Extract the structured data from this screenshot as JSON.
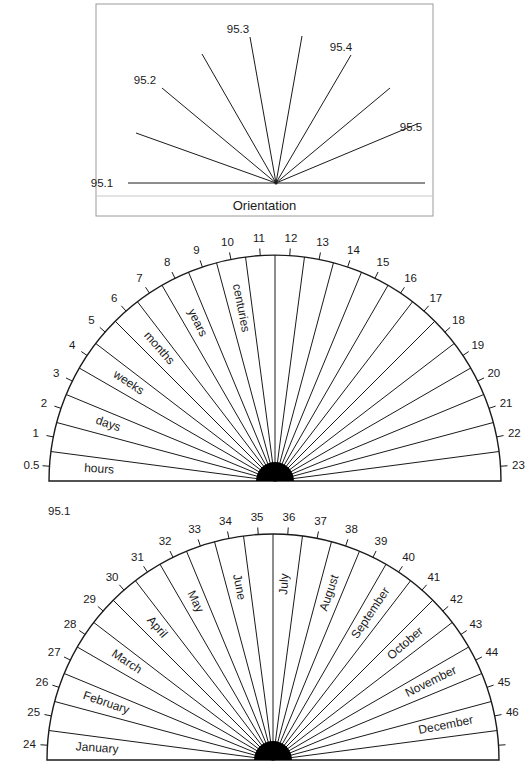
{
  "orientation_panel": {
    "caption": "Orientation",
    "box": {
      "x": 96,
      "y": 4,
      "w": 337,
      "h": 212,
      "separator_y": 196
    },
    "center": [
      276,
      183
    ],
    "lines": [
      {
        "to": [
          128,
          183
        ]
      },
      {
        "to": [
          425,
          183
        ]
      },
      {
        "to": [
          136,
          133
        ]
      },
      {
        "to": [
          162,
          88
        ]
      },
      {
        "to": [
          202,
          54
        ]
      },
      {
        "to": [
          250,
          37
        ]
      },
      {
        "to": [
          302,
          36
        ]
      },
      {
        "to": [
          351,
          55
        ]
      },
      {
        "to": [
          390,
          88
        ]
      },
      {
        "to": [
          417,
          124
        ]
      }
    ],
    "labels": [
      {
        "text": "95.1",
        "x": 102,
        "y": 187
      },
      {
        "text": "95.2",
        "x": 145,
        "y": 84
      },
      {
        "text": "95.3",
        "x": 238,
        "y": 33
      },
      {
        "text": "95.4",
        "x": 341,
        "y": 51
      },
      {
        "text": "95.5",
        "x": 411,
        "y": 131
      }
    ]
  },
  "time_scale_dial": {
    "center": [
      275,
      481
    ],
    "radius": 226,
    "hub_radius": 19,
    "segments": 24,
    "tick_labels": [
      "0.5",
      "1",
      "2",
      "3",
      "4",
      "5",
      "6",
      "7",
      "8",
      "9",
      "10",
      "11",
      "12",
      "13",
      "14",
      "15",
      "16",
      "17",
      "18",
      "19",
      "20",
      "21",
      "22",
      "23"
    ],
    "segment_labels": [
      {
        "segment": 0,
        "text": "hours"
      },
      {
        "segment": 2,
        "text": "days"
      },
      {
        "segment": 4,
        "text": "weeks"
      },
      {
        "segment": 6,
        "text": "months"
      },
      {
        "segment": 8,
        "text": "years"
      },
      {
        "segment": 10,
        "text": "centuries"
      }
    ]
  },
  "figure_label": {
    "text": "95.1",
    "x": 48,
    "y": 515
  },
  "months_dial": {
    "center": [
      273,
      760
    ],
    "radius": 226,
    "hub_radius": 19,
    "segments": 24,
    "tick_labels": [
      "24",
      "25",
      "26",
      "27",
      "28",
      "29",
      "30",
      "31",
      "32",
      "33",
      "34",
      "35",
      "36",
      "37",
      "38",
      "39",
      "40",
      "41",
      "42",
      "43",
      "44",
      "45",
      "46",
      ""
    ],
    "segment_labels": [
      {
        "segment": 0,
        "text": "January"
      },
      {
        "segment": 2,
        "text": "February"
      },
      {
        "segment": 4,
        "text": "March"
      },
      {
        "segment": 6,
        "text": "April"
      },
      {
        "segment": 8,
        "text": "May"
      },
      {
        "segment": 10,
        "text": "June"
      },
      {
        "segment": 12,
        "text": "July"
      },
      {
        "segment": 14,
        "text": "August"
      },
      {
        "segment": 16,
        "text": "September"
      },
      {
        "segment": 18,
        "text": "October"
      },
      {
        "segment": 20,
        "text": "November"
      },
      {
        "segment": 22,
        "text": "December"
      }
    ]
  },
  "colors": {
    "ink": "#1a1a1a",
    "box_border": "#9a9a9a",
    "separator": "#c8c8c8",
    "background": "#ffffff"
  }
}
